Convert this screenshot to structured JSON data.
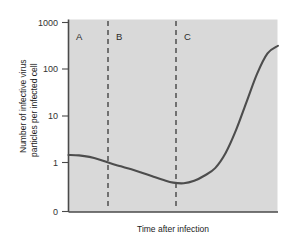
{
  "chart_data": {
    "type": "line",
    "title": "",
    "subtitle": "",
    "xlabel": "Time after infection",
    "ylabel_line1": "Number of infective virus",
    "ylabel_line2": "particles per infected cell",
    "ylabel": "Number of infective virus particles per infected cell",
    "yscale": "log",
    "ytick_labels": [
      "1000",
      "100",
      "10",
      "1",
      "0"
    ],
    "ytick_values": [
      1000,
      100,
      10,
      1,
      0
    ],
    "ylim": [
      0,
      1000
    ],
    "xtick_labels": [],
    "xlim_label": "",
    "grid": false,
    "legend_position": "none",
    "plot_background": "#d9d9d9",
    "series": [
      {
        "name": "Infective virus particles per cell",
        "color": "#4d4d4d",
        "x": [
          0,
          5,
          10,
          15,
          20,
          25,
          30,
          35,
          40,
          45,
          50,
          55,
          60,
          65,
          70,
          75,
          80,
          85,
          90,
          95,
          100
        ],
        "values": [
          1.45,
          1.42,
          1.32,
          1.15,
          0.93,
          0.72,
          0.56,
          0.42,
          0.31,
          0.23,
          0.18,
          0.17,
          0.21,
          0.33,
          0.62,
          1.6,
          5.0,
          20.0,
          80.0,
          220.0,
          320.0
        ]
      }
    ],
    "annotations": [
      {
        "label": "A",
        "type": "phase-label",
        "x_frac": 0.045,
        "y_frac": 0.06
      },
      {
        "label": "B",
        "type": "phase-label",
        "x_frac": 0.245,
        "y_frac": 0.06
      },
      {
        "label": "C",
        "type": "phase-label",
        "x_frac": 0.565,
        "y_frac": 0.06
      }
    ],
    "vertical_dashed_lines": [
      {
        "label": "boundary-A-B",
        "x_frac": 0.19,
        "color": "#3a3a3a"
      },
      {
        "label": "boundary-B-C",
        "x_frac": 0.515,
        "color": "#3a3a3a"
      }
    ]
  }
}
